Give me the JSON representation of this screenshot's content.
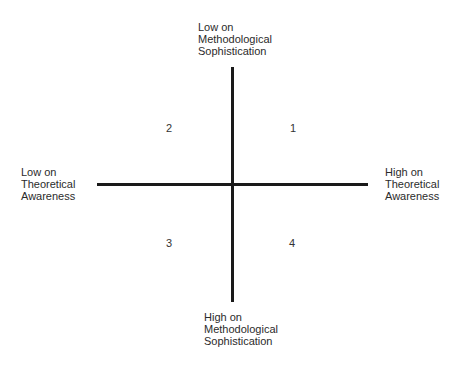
{
  "diagram": {
    "type": "quadrant",
    "axes": {
      "vertical": {
        "top_label": [
          "Low on",
          "Methodological",
          "Sophistication"
        ],
        "bottom_label": [
          "High on",
          "Methodological",
          "Sophistication"
        ]
      },
      "horizontal": {
        "left_label": [
          "Low on",
          "Theoretical",
          "Awareness"
        ],
        "right_label": [
          "High on",
          "Theoretical",
          "Awareness"
        ]
      }
    },
    "quadrants": {
      "top_right": "1",
      "top_left": "2",
      "bottom_left": "3",
      "bottom_right": "4"
    },
    "line_color": "#1a1a1a",
    "text_color": "#2b2b2b"
  }
}
